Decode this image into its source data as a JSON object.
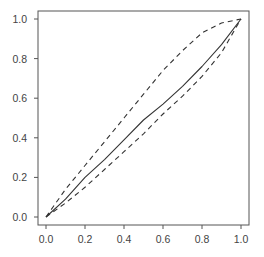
{
  "chart_data": {
    "type": "line",
    "title": "",
    "xlabel": "",
    "ylabel": "",
    "xlim": [
      0.0,
      1.0
    ],
    "ylim": [
      0.0,
      1.0
    ],
    "grid": false,
    "legend": null,
    "x_ticks": [
      "0.0",
      "0.2",
      "0.4",
      "0.6",
      "0.8",
      "1.0"
    ],
    "y_ticks": [
      "0.0",
      "0.2",
      "0.4",
      "0.6",
      "0.8",
      "1.0"
    ],
    "x": [
      0.0,
      0.1,
      0.2,
      0.3,
      0.4,
      0.5,
      0.6,
      0.7,
      0.8,
      0.9,
      1.0
    ],
    "series": [
      {
        "name": "estimate",
        "style": "solid",
        "values": [
          0.0,
          0.09,
          0.2,
          0.29,
          0.39,
          0.49,
          0.57,
          0.66,
          0.76,
          0.87,
          1.0
        ]
      },
      {
        "name": "upper band",
        "style": "dashed",
        "values": [
          0.0,
          0.14,
          0.26,
          0.38,
          0.5,
          0.62,
          0.74,
          0.84,
          0.93,
          0.98,
          1.0
        ]
      },
      {
        "name": "lower band",
        "style": "dashed",
        "values": [
          0.0,
          0.07,
          0.15,
          0.24,
          0.33,
          0.42,
          0.52,
          0.61,
          0.71,
          0.83,
          1.0
        ]
      }
    ]
  },
  "colors": {
    "axis": "#555555",
    "line": "#333333",
    "text": "#444444"
  }
}
